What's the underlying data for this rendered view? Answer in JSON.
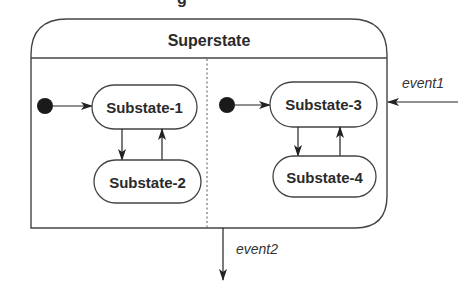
{
  "diagram": {
    "type": "UML state diagram (concurrent composite state)",
    "caption_fragment": "g",
    "superstate": {
      "label": "Superstate"
    },
    "regions": [
      {
        "id": "left",
        "initial": true,
        "substates": [
          {
            "label": "Substate-1"
          },
          {
            "label": "Substate-2"
          }
        ],
        "transitions": [
          {
            "from": "initial",
            "to": "Substate-1"
          },
          {
            "from": "Substate-1",
            "to": "Substate-2"
          },
          {
            "from": "Substate-2",
            "to": "Substate-1"
          }
        ]
      },
      {
        "id": "right",
        "initial": true,
        "substates": [
          {
            "label": "Substate-3"
          },
          {
            "label": "Substate-4"
          }
        ],
        "transitions": [
          {
            "from": "initial",
            "to": "Substate-3"
          },
          {
            "from": "Substate-3",
            "to": "Substate-4"
          },
          {
            "from": "Substate-4",
            "to": "Substate-3"
          }
        ]
      }
    ],
    "events": [
      {
        "label": "event1",
        "direction": "into superstate"
      },
      {
        "label": "event2",
        "direction": "out of superstate"
      }
    ],
    "colors": {
      "stroke": "#3a3a3a",
      "fill": "#ffffff",
      "initial": "#1a1a1a"
    }
  }
}
